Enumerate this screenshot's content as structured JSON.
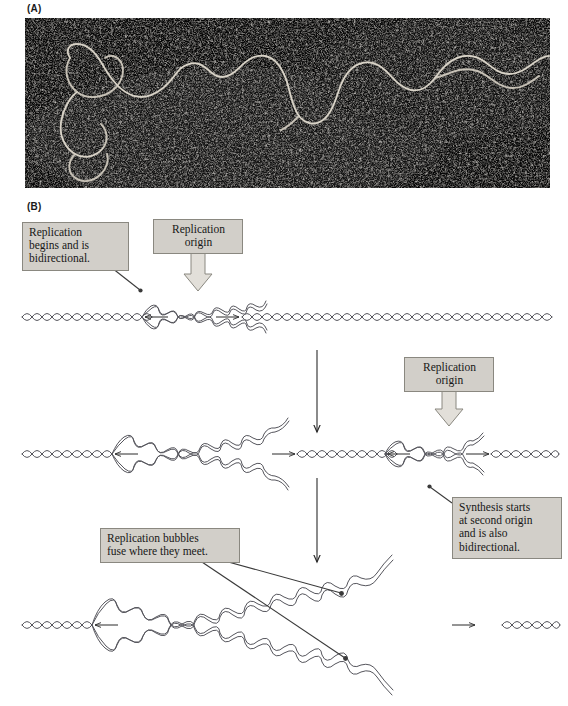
{
  "figure": {
    "panels": [
      {
        "id": "A",
        "label": "(A)",
        "type": "electron-micrograph",
        "description": "Dark-field electron micrograph of replicating DNA showing light filamentous DNA strands against a dark stippled background"
      },
      {
        "id": "B",
        "label": "(B)",
        "type": "schematic-diagram",
        "description": "Three-stage schematic of bidirectional DNA replication from multiple origins"
      }
    ]
  },
  "callouts": {
    "bidirectional": "Replication\nbegins and is\nbidirectional.",
    "origin_1": "Replication\norigin",
    "origin_2": "Replication\norigin",
    "second_origin": "Synthesis starts\nat second origin\nand is also\nbidirectional.",
    "fuse": "Replication bubbles\nfuse where they meet."
  },
  "stages": [
    {
      "name": "stage-1-single-bubble",
      "bubbles": 1,
      "fork_arrows": [
        "left",
        "right"
      ],
      "y_center": 317
    },
    {
      "name": "stage-2-two-bubbles",
      "bubbles": 2,
      "fork_arrows": [
        "left",
        "right",
        "left",
        "right"
      ],
      "y_center": 454
    },
    {
      "name": "stage-3-fused-bubble",
      "bubbles": 1,
      "fork_arrows": [
        "left",
        "right"
      ],
      "y_center": 625
    }
  ],
  "flow_arrows": [
    {
      "name": "stage-1-to-2",
      "from_y": 350,
      "to_y": 432
    },
    {
      "name": "stage-2-to-3",
      "from_y": 478,
      "to_y": 562
    }
  ],
  "colors": {
    "callout_fill": "#d2cfc9",
    "callout_border": "#8a8880",
    "dna_stroke": "#55555c",
    "arrow_stroke": "#2b2b2b",
    "origin_arrow_fill": "#e2dfd9",
    "micrograph_background": "#0a0a0a",
    "page_background": "#ffffff",
    "text": "#171717"
  }
}
